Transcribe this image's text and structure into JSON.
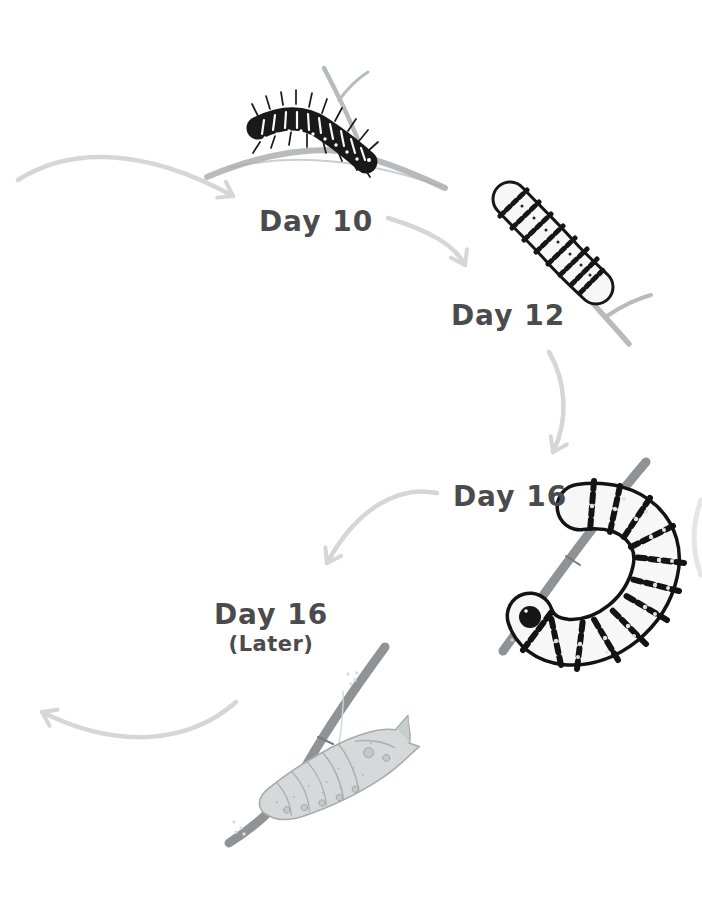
{
  "page": {
    "background_color": "#ffffff"
  },
  "diagram": {
    "kind": "hand-drawn caterpillar life-cycle sequence",
    "stages": [
      {
        "label": "Day 10",
        "illustration": "early-instar-spiky-caterpillar-on-twig"
      },
      {
        "label": "Day 12",
        "illustration": "striped-caterpillar-on-twig"
      },
      {
        "label": "Day 16",
        "illustration": "large-j-shaped-caterpillar-hanging-on-twig"
      },
      {
        "label": "Day 16",
        "sublabel": "(Later)",
        "illustration": "chrysalis-hanging-on-twig"
      }
    ],
    "arrows": [
      {
        "name": "into-day-10"
      },
      {
        "name": "day-10-to-day-12"
      },
      {
        "name": "day-12-to-day-16"
      },
      {
        "name": "day-16-to-day-16-later"
      },
      {
        "name": "day-16-later-outgoing"
      },
      {
        "name": "right-edge-arc-fragment"
      }
    ],
    "colors": {
      "arrow": "#d6d6d6",
      "label_text": "#4b4b4b",
      "twig_light": "#b7bbbe",
      "twig_dark": "#8f9396",
      "caterpillar_dark": "#191919",
      "caterpillar_light": "#f7f7f7",
      "chrysalis_fill": "#d5d9d9",
      "chrysalis_line": "#a6acac"
    }
  }
}
